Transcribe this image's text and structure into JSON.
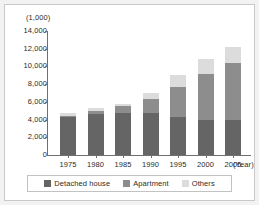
{
  "chart_data": {
    "type": "bar",
    "subtype": "stacked-bar",
    "title": "",
    "xlabel": "(Year)",
    "ylabel": "(1,000)",
    "categories": [
      "1975",
      "1980",
      "1985",
      "1990",
      "1995",
      "2000",
      "2005"
    ],
    "series": [
      {
        "name": "Detached house",
        "color": "#656565",
        "values": [
          4300,
          4600,
          4700,
          4700,
          4300,
          4000,
          4000
        ]
      },
      {
        "name": "Apartment",
        "color": "#8d8d8d",
        "values": [
          100,
          400,
          800,
          1600,
          3400,
          5100,
          6400
        ]
      },
      {
        "name": "Others",
        "color": "#dcdcdc",
        "values": [
          300,
          300,
          300,
          700,
          1300,
          1700,
          1800
        ]
      }
    ],
    "totals": [
      4700,
      5300,
      5800,
      7000,
      9000,
      10800,
      12200
    ],
    "ylim": [
      0,
      14000
    ],
    "yticks": [
      "0",
      "2,000",
      "4,000",
      "6,000",
      "8,000",
      "10,000",
      "12,000",
      "14,000"
    ],
    "ytick_values": [
      0,
      2000,
      4000,
      6000,
      8000,
      10000,
      12000,
      14000
    ],
    "grid": false,
    "legend_position": "bottom"
  },
  "legend": {
    "items": [
      {
        "label": "Detached house",
        "color": "#656565"
      },
      {
        "label": "Apartment",
        "color": "#8d8d8d"
      },
      {
        "label": "Others",
        "color": "#dcdcdc"
      }
    ]
  }
}
